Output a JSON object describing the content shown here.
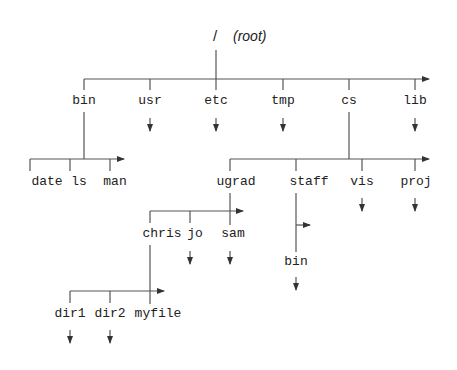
{
  "diagram": {
    "type": "directory-tree",
    "root": {
      "symbol": "/",
      "label": "(root)"
    },
    "level1": {
      "bin": "bin",
      "usr": "usr",
      "etc": "etc",
      "tmp": "tmp",
      "cs": "cs",
      "lib": "lib"
    },
    "bin_children": {
      "date": "date",
      "ls": "ls",
      "man": "man"
    },
    "cs_children": {
      "ugrad": "ugrad",
      "staff": "staff",
      "vis": "vis",
      "proj": "proj"
    },
    "ugrad_children": {
      "chris": "chris",
      "jo": "jo",
      "sam": "sam"
    },
    "staff_children": {
      "bin": "bin"
    },
    "chris_children": {
      "dir1": "dir1",
      "dir2": "dir2",
      "myfile": "myfile"
    },
    "colors": {
      "line": "#555555",
      "text": "#222222",
      "background": "#ffffff"
    }
  }
}
